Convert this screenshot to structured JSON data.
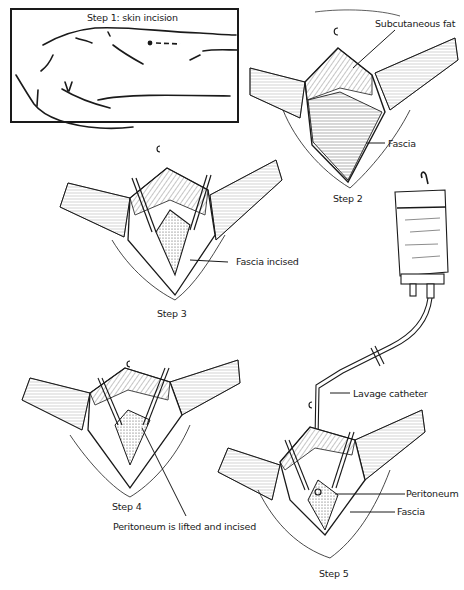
{
  "figure": {
    "steps": [
      {
        "id": 1,
        "label": "Step 1: skin incision",
        "annotations": []
      },
      {
        "id": 2,
        "label": "Step 2",
        "annotations": [
          "Subcutaneous fat",
          "Fascia"
        ]
      },
      {
        "id": 3,
        "label": "Step 3",
        "annotations": [
          "Fascia incised"
        ]
      },
      {
        "id": 4,
        "label": "Step 4",
        "annotations": [
          "Peritoneum is lifted and incised"
        ]
      },
      {
        "id": 5,
        "label": "Step 5",
        "annotations": [
          "Lavage catheter",
          "Peritoneum",
          "Fascia"
        ]
      }
    ]
  },
  "labels": {
    "step1": "Step 1: skin incision",
    "step2": "Step 2",
    "step3": "Step 3",
    "step4": "Step 4",
    "step5": "Step 5",
    "subcutaneous_fat": "Subcutaneous fat",
    "fascia_step2": "Fascia",
    "fascia_incised": "Fascia incised",
    "peritoneum_lifted": "Peritoneum is lifted and incised",
    "lavage_catheter": "Lavage catheter",
    "peritoneum_step5": "Peritoneum",
    "fascia_step5": "Fascia"
  },
  "colors": {
    "ink": "#1a1a1a",
    "background": "#ffffff",
    "stipple": "#555555"
  }
}
